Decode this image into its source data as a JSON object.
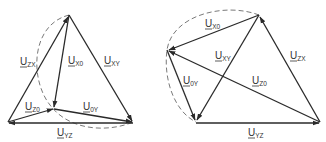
{
  "colors": {
    "line": "#2a2a2a",
    "arc": "#6a6a6a",
    "text": "#333333",
    "background": "#ffffff"
  },
  "diagrams": [
    {
      "name": "left-phasor-diagram",
      "labels": {
        "zx": {
          "main": "U",
          "sub": "ZX"
        },
        "x0": {
          "main": "U",
          "sub": "X0"
        },
        "xy": {
          "main": "U",
          "sub": "XY"
        },
        "z0": {
          "main": "U",
          "sub": "Z0"
        },
        "0y": {
          "main": "U",
          "sub": "0Y"
        },
        "yz": {
          "main": "U",
          "sub": "YZ"
        }
      }
    },
    {
      "name": "right-phasor-diagram",
      "labels": {
        "x0": {
          "main": "U",
          "sub": "X0"
        },
        "xy": {
          "main": "U",
          "sub": "XY"
        },
        "zx": {
          "main": "U",
          "sub": "ZX"
        },
        "0y": {
          "main": "U",
          "sub": "0Y"
        },
        "z0": {
          "main": "U",
          "sub": "Z0"
        },
        "yz": {
          "main": "U",
          "sub": "YZ"
        }
      }
    }
  ]
}
